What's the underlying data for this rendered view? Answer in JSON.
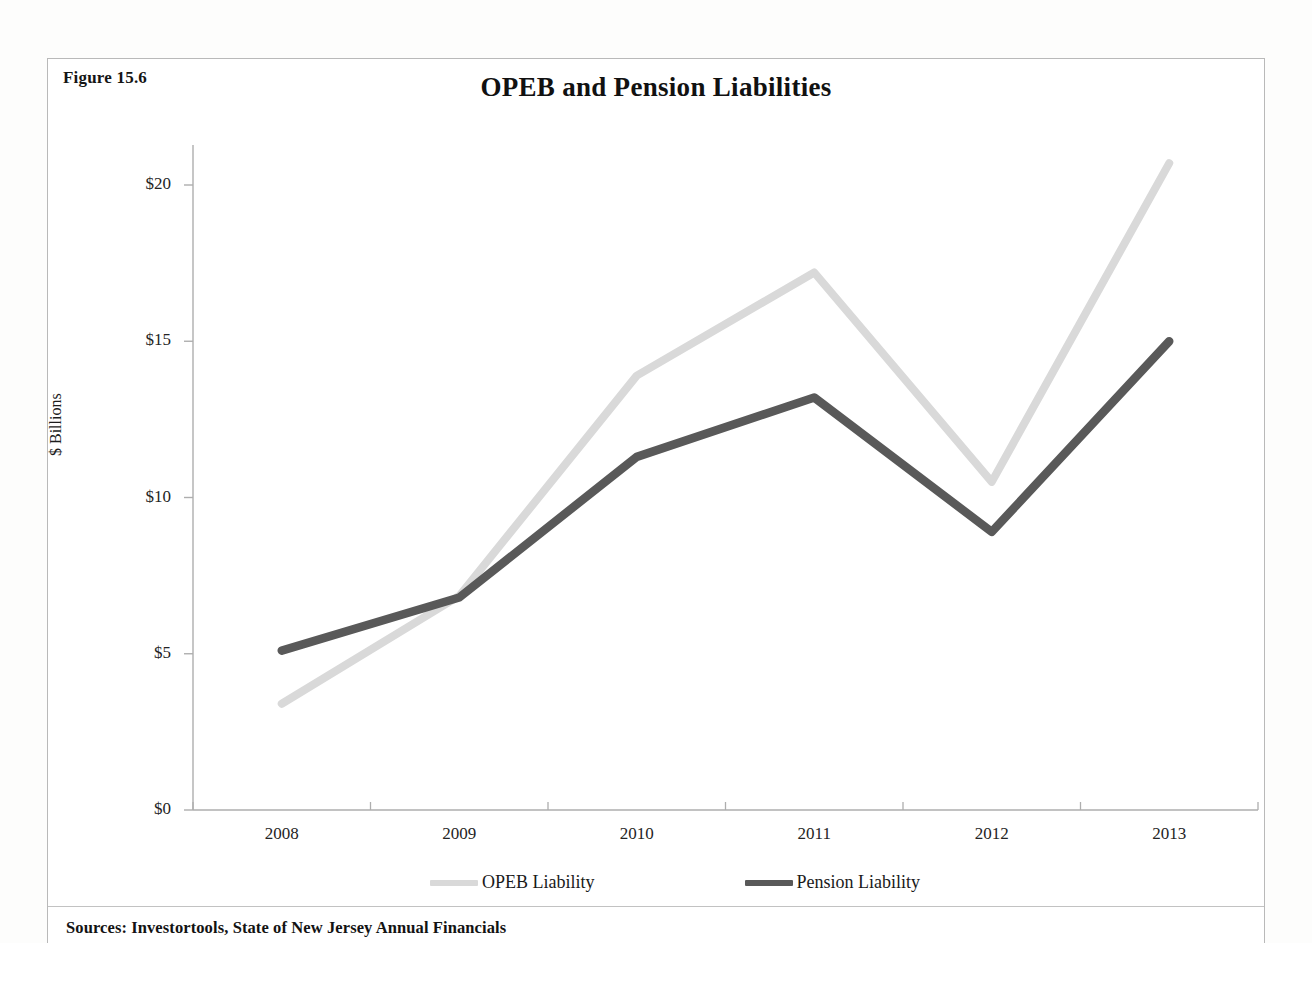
{
  "figure": {
    "label": "Figure 15.6",
    "title": "OPEB and Pension Liabilities",
    "source": "Sources: Investortools, State of New Jersey Annual Financials"
  },
  "axes": {
    "y_title": "$ Billions",
    "y_ticks": [
      "$0",
      "$5",
      "$10",
      "$15",
      "$20"
    ],
    "x_ticks": [
      "2008",
      "2009",
      "2010",
      "2011",
      "2012",
      "2013"
    ]
  },
  "legend": {
    "items": [
      {
        "label": "OPEB Liability",
        "color": "#d9d9d9"
      },
      {
        "label": "Pension Liability",
        "color": "#595959"
      }
    ]
  },
  "chart_data": {
    "type": "line",
    "title": "OPEB and Pension Liabilities",
    "xlabel": "",
    "ylabel": "$ Billions",
    "categories": [
      "2008",
      "2009",
      "2010",
      "2011",
      "2012",
      "2013"
    ],
    "ylim": [
      0,
      22
    ],
    "yticks": [
      0,
      5,
      10,
      15,
      20
    ],
    "ytick_labels": [
      "$0",
      "$5",
      "$10",
      "$15",
      "$20"
    ],
    "grid": false,
    "legend_position": "bottom",
    "series": [
      {
        "name": "OPEB Liability",
        "color": "#d9d9d9",
        "values": [
          3.4,
          6.85,
          13.9,
          17.2,
          10.5,
          20.7
        ]
      },
      {
        "name": "Pension Liability",
        "color": "#595959",
        "values": [
          5.1,
          6.8,
          11.3,
          13.2,
          8.9,
          15.0
        ]
      }
    ],
    "annotations": [
      "Figure 15.6",
      "Sources: Investortools, State of New Jersey Annual Financials"
    ]
  }
}
